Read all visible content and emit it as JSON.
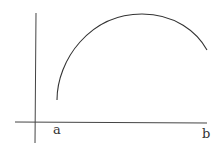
{
  "diagram": {
    "type": "function-curve-on-axes",
    "labels": {
      "a": "a",
      "b": "b"
    },
    "stroke_color": "#333333",
    "background": "#ffffff"
  }
}
